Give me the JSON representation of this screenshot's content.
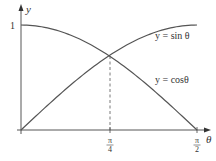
{
  "chart_data": {
    "type": "line",
    "title": "",
    "xlabel": "θ",
    "ylabel": "y",
    "xlim": [
      0,
      1.5708
    ],
    "ylim": [
      0,
      1
    ],
    "grid": false,
    "legend": "inline labels",
    "x_ticks": [
      {
        "value": 0.7854,
        "label_num": "π",
        "label_den": "4"
      },
      {
        "value": 1.5708,
        "label_num": "π",
        "label_den": "2"
      }
    ],
    "y_ticks": [
      {
        "value": 1,
        "label": "1"
      }
    ],
    "series": [
      {
        "name": "y = sinθ",
        "label_text": "y = sin θ",
        "function": "sin",
        "x": [
          0,
          0.3927,
          0.7854,
          1.1781,
          1.5708
        ],
        "values": [
          0,
          0.383,
          0.707,
          0.924,
          1
        ]
      },
      {
        "name": "y = cosθ",
        "label_text": "y = cosθ",
        "function": "cos",
        "x": [
          0,
          0.3927,
          0.7854,
          1.1781,
          1.5708
        ],
        "values": [
          1,
          0.924,
          0.707,
          0.383,
          0
        ]
      }
    ],
    "annotations": [
      {
        "type": "dashed-vertical",
        "x": 0.7854,
        "from_y": 0,
        "to_y": 0.707
      }
    ]
  },
  "labels": {
    "y_axis": "y",
    "x_axis": "θ",
    "y_one": "1",
    "sin_label": "y = sin θ",
    "cos_label": "y = cosθ",
    "pi": "π",
    "four": "4",
    "two": "2"
  }
}
